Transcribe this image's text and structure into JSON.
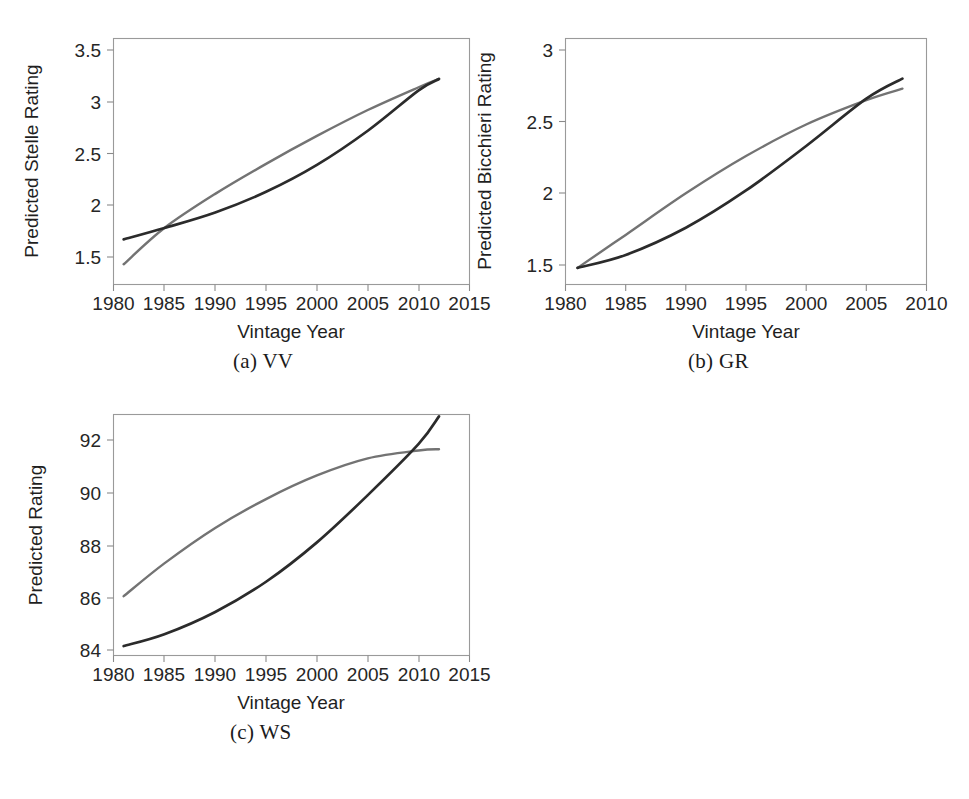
{
  "figure": {
    "background": "#ffffff",
    "panel_count": 3
  },
  "colors": {
    "series_dark": "#2b2b2b",
    "series_gray": "#737373",
    "frame": "#9a9a9a",
    "tick": "#8a8a8a",
    "text": "#262626"
  },
  "panels": [
    {
      "key": "vv",
      "caption": "(a) VV",
      "xlabel": "Vintage Year",
      "ylabel": "Predicted Stelle Rating"
    },
    {
      "key": "gr",
      "caption": "(b) GR",
      "xlabel": "Vintage Year",
      "ylabel": "Predicted Bicchieri Rating"
    },
    {
      "key": "ws",
      "caption": "(c) WS",
      "xlabel": "Vintage Year",
      "ylabel": "Predicted Rating"
    }
  ],
  "chart_data": [
    {
      "type": "line",
      "key": "vv",
      "title": "(a) VV",
      "xlabel": "Vintage Year",
      "ylabel": "Predicted Stelle Rating",
      "xlim": [
        1980,
        2015
      ],
      "ylim": [
        1.5,
        3.5
      ],
      "xticks": [
        1980,
        1985,
        1990,
        1995,
        2000,
        2005,
        2010,
        2015
      ],
      "xtick_labels": [
        "1980",
        "1985",
        "1990",
        "1995",
        "2000",
        "2005",
        "2010",
        "2015"
      ],
      "yticks": [
        1.5,
        2,
        2.5,
        3,
        3.5
      ],
      "ytick_labels": [
        "1.5",
        "2",
        "2.5",
        "3",
        "3.5"
      ],
      "grid": false,
      "legend": "none",
      "series": [
        {
          "name": "dark",
          "color": "#2b2b2b",
          "x": [
            1981,
            1985,
            1990,
            1995,
            2000,
            2005,
            2010,
            2012
          ],
          "y": [
            1.67,
            1.78,
            1.93,
            2.13,
            2.39,
            2.72,
            3.11,
            3.22
          ]
        },
        {
          "name": "gray",
          "color": "#737373",
          "x": [
            1981,
            1985,
            1990,
            1995,
            2000,
            2005,
            2010,
            2012
          ],
          "y": [
            1.43,
            1.78,
            2.11,
            2.4,
            2.67,
            2.92,
            3.14,
            3.22
          ]
        }
      ]
    },
    {
      "type": "line",
      "key": "gr",
      "title": "(b) GR",
      "xlabel": "Vintage Year",
      "ylabel": "Predicted Bicchieri Rating",
      "xlim": [
        1980,
        2010
      ],
      "ylim": [
        1.5,
        3.0
      ],
      "xticks": [
        1980,
        1985,
        1990,
        1995,
        2000,
        2005,
        2010
      ],
      "xtick_labels": [
        "1980",
        "1985",
        "1990",
        "1995",
        "2000",
        "2005",
        "2010"
      ],
      "yticks": [
        1.5,
        2,
        2.5,
        3
      ],
      "ytick_labels": [
        "1.5",
        "2",
        "2.5",
        "3"
      ],
      "grid": false,
      "legend": "none",
      "series": [
        {
          "name": "dark",
          "color": "#2b2b2b",
          "x": [
            1981,
            1985,
            1990,
            1995,
            2000,
            2005,
            2008
          ],
          "y": [
            1.48,
            1.57,
            1.76,
            2.02,
            2.33,
            2.66,
            2.8
          ]
        },
        {
          "name": "gray",
          "color": "#737373",
          "x": [
            1981,
            1985,
            1990,
            1995,
            2000,
            2005,
            2008
          ],
          "y": [
            1.48,
            1.71,
            2.0,
            2.26,
            2.48,
            2.65,
            2.73
          ]
        }
      ]
    },
    {
      "type": "line",
      "key": "ws",
      "title": "(c) WS",
      "xlabel": "Vintage Year",
      "ylabel": "Predicted Rating",
      "xlim": [
        1980,
        2015
      ],
      "ylim": [
        84,
        93
      ],
      "xticks": [
        1980,
        1985,
        1990,
        1995,
        2000,
        2005,
        2010,
        2015
      ],
      "xtick_labels": [
        "1980",
        "1985",
        "1990",
        "1995",
        "2000",
        "2005",
        "2010",
        "2015"
      ],
      "yticks": [
        84,
        86,
        88,
        90,
        92
      ],
      "ytick_labels": [
        "84",
        "86",
        "88",
        "90",
        "92"
      ],
      "grid": false,
      "legend": "none",
      "series": [
        {
          "name": "dark",
          "color": "#2b2b2b",
          "x": [
            1981,
            1985,
            1990,
            1995,
            2000,
            2005,
            2010,
            2012
          ],
          "y": [
            84.15,
            84.6,
            85.45,
            86.6,
            88.1,
            89.9,
            91.85,
            92.9
          ]
        },
        {
          "name": "gray",
          "color": "#737373",
          "x": [
            1981,
            1985,
            1990,
            1995,
            2000,
            2005,
            2010,
            2012
          ],
          "y": [
            86.05,
            87.3,
            88.65,
            89.75,
            90.65,
            91.3,
            91.6,
            91.65
          ]
        }
      ]
    }
  ]
}
